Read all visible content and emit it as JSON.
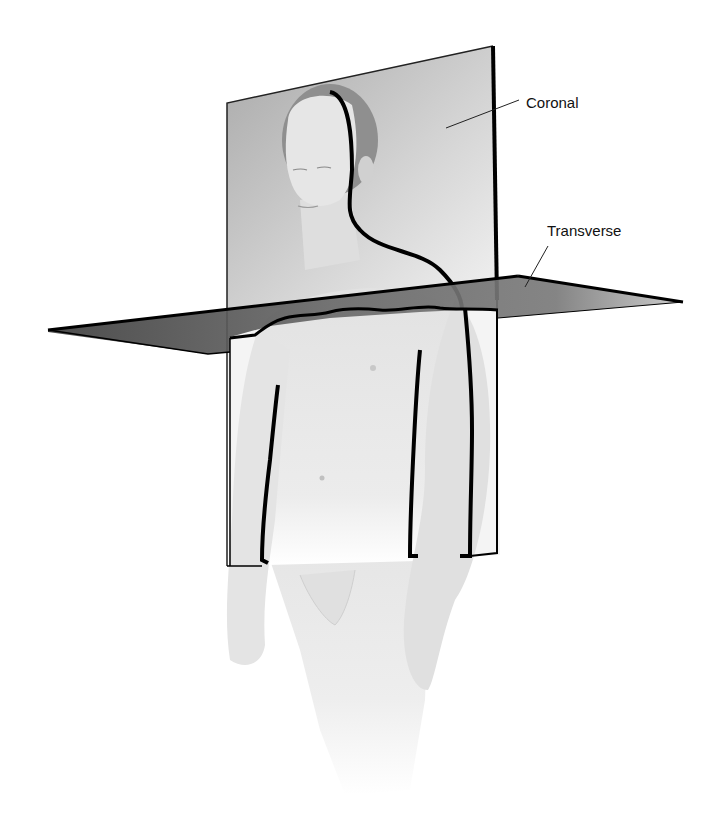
{
  "figure": {
    "labels": {
      "coronal": "Coronal",
      "transverse": "Transverse"
    },
    "colors": {
      "background": "#ffffff",
      "plane_coronal": "#b8b8b8",
      "plane_transverse": "#5a5a5a",
      "outline": "#000000",
      "skin": "#e6e6e6",
      "hair": "#8c8c8c"
    }
  }
}
